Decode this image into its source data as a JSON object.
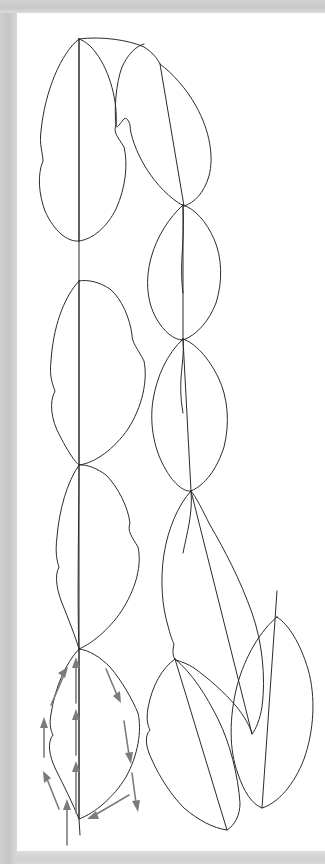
{
  "figure": {
    "page_background": "#ffffff",
    "margin_color": "#c9c9c9",
    "ink_color": "#2b2b2b",
    "arrow_color": "#7b7b7b",
    "canvas": {
      "width": 325,
      "height": 864
    },
    "sheet": {
      "left": 17,
      "top": 13,
      "width": 308,
      "height": 838
    }
  },
  "diagram": {
    "type": "botanical-line-drawing",
    "stem": {
      "name": "main-stem",
      "orientation": "vertical",
      "node_count": 4,
      "path": "M 62 26 L 62 228 L 62 268 C 62 300 62 380 62 452 L 62 490 C 62 540 60 590 62 636 L 62 806 L 63 822"
    },
    "leaves": [
      {
        "id": "leaf-1-left",
        "side": "left",
        "order": 1,
        "lobed": true,
        "notch_side": "both",
        "outline": "M 62 26 C 42 40 26 78 22 118 C 20 134 24 140 25 148 C 20 160 22 180 28 196 C 36 216 50 228 62 228 C 76 226 90 214 98 196 C 108 174 110 150 106 134 C 100 124 96 120 98 112 C 100 90 92 58 78 40 C 73 33 67 28 62 26 Z",
        "midrib": "M 62 26 L 62 228"
      },
      {
        "id": "leaf-2-right",
        "side": "right",
        "order": 1,
        "lobed": true,
        "notch_side": "left",
        "outline": "M 62 26 C 84 24 110 28 124 34 C 132 38 138 44 141 50 C 152 58 166 72 176 90 C 190 114 194 140 190 160 C 185 178 176 188 166 192 C 152 186 138 172 128 156 C 118 140 112 122 112 112 C 110 106 108 104 106 106 C 102 110 98 116 98 112 C 96 96 98 70 104 54 C 110 42 118 34 124 32",
        "midrib": "M 141 50 L 166 192"
      },
      {
        "id": "leaf-3-right",
        "side": "right",
        "order": 2,
        "lobed": false,
        "outline": "M 166 192 C 152 204 140 222 134 244 C 128 266 130 288 138 304 C 146 318 156 326 166 326 C 180 322 192 308 198 290 C 205 268 204 244 196 226 C 188 208 178 196 166 192 Z",
        "midrib": "M 166 192 L 166 326"
      },
      {
        "id": "leaf-4-left",
        "side": "left",
        "order": 2,
        "lobed": true,
        "notch_side": "both",
        "outline": "M 62 268 C 46 284 36 316 34 348 C 32 364 36 372 38 378 C 32 388 34 406 42 422 C 52 440 62 450 62 452 C 78 450 96 436 110 416 C 124 394 130 368 126 348 C 120 336 114 330 114 322 C 112 306 104 286 92 276 C 84 270 72 266 62 268 Z",
        "midrib": "M 62 268 L 62 452"
      },
      {
        "id": "leaf-5-right",
        "side": "right",
        "order": 3,
        "lobed": false,
        "outline": "M 166 326 C 150 340 140 362 136 386 C 132 412 138 438 148 456 C 156 470 166 478 174 478 C 188 472 200 456 206 434 C 212 410 210 384 200 364 C 190 344 178 330 166 326 Z",
        "midrib": "M 166 326 L 174 478"
      },
      {
        "id": "leaf-6-left",
        "side": "left",
        "order": 3,
        "lobed": true,
        "notch_side": "left",
        "outline": "M 62 452 C 50 468 42 498 40 524 C 38 540 40 548 42 554 C 38 562 40 578 46 594 C 54 614 60 628 62 636 C 76 630 94 614 106 594 C 118 574 124 552 120 534 C 114 524 110 518 112 510 C 110 494 100 474 88 462 C 80 456 70 452 62 452 Z",
        "midrib": "M 62 452 L 62 636"
      },
      {
        "id": "leaf-7-right",
        "side": "right",
        "order": 4,
        "lobed": true,
        "notch_side": "left",
        "outline": "M 174 478 C 160 492 150 516 146 540 C 142 566 144 592 150 612 C 152 620 154 626 156 630 C 154 638 155 644 158 646 C 164 648 170 650 176 654 C 190 664 206 678 218 692 C 226 702 232 712 234 720 C 238 716 242 706 244 694 C 248 664 244 628 234 600 C 222 566 206 536 192 512 C 184 496 178 484 174 478 Z",
        "midrib": "M 174 478 L 234 720"
      },
      {
        "id": "leaf-8-far-right",
        "side": "right",
        "order": 5,
        "lobed": false,
        "outline": "M 260 604 C 244 616 228 642 220 672 C 212 704 212 736 220 760 C 226 778 234 790 244 794 C 260 790 276 772 286 746 C 296 718 298 684 290 656 C 282 630 272 612 260 604 Z",
        "midrib": "M 260 580 L 244 794"
      },
      {
        "id": "leaf-9-lower-left",
        "side": "left",
        "order": 6,
        "lobed": true,
        "notch_side": "left",
        "outline": "M 62 636 C 48 650 38 674 34 700 C 32 712 34 718 36 722 C 30 728 32 742 38 756 C 46 772 56 790 62 806 C 78 800 96 784 108 764 C 120 742 124 718 120 700 C 114 686 104 668 92 654 C 82 644 72 638 62 636 Z",
        "midrib": "M 62 636 L 62 806"
      },
      {
        "id": "leaf-10-lower-right",
        "side": "right",
        "order": 7,
        "lobed": true,
        "notch_side": "left",
        "outline": "M 158 646 C 144 654 134 672 130 694 C 128 706 130 712 132 716 C 126 722 128 734 134 746 C 142 764 154 782 166 794 C 180 806 196 814 210 816 C 218 812 222 802 222 790 C 220 762 212 730 200 706 C 188 682 174 660 158 646 Z",
        "midrib": "M 158 646 L 210 816"
      }
    ],
    "arrows": {
      "name": "airflow-arrows",
      "color": "#7b7b7b",
      "count": 12,
      "description": "Gray arrows around the lowest left leaf: upward along the midrib and left margin, downward along the right margin, converging at the base.",
      "items": [
        {
          "id": "arrow-midrib-lower",
          "direction": "up",
          "x1": 59,
          "y1": 800,
          "x2": 59,
          "y2": 752
        },
        {
          "id": "arrow-midrib-mid",
          "direction": "up",
          "x1": 59,
          "y1": 742,
          "x2": 59,
          "y2": 700
        },
        {
          "id": "arrow-midrib-upper",
          "direction": "up",
          "x1": 59,
          "y1": 690,
          "x2": 59,
          "y2": 648
        },
        {
          "id": "arrow-left-upper",
          "direction": "up-right",
          "x1": 36,
          "y1": 692,
          "x2": 50,
          "y2": 656
        },
        {
          "id": "arrow-left-mid",
          "direction": "up",
          "x1": 27,
          "y1": 742,
          "x2": 27,
          "y2": 708
        },
        {
          "id": "arrow-left-lower",
          "direction": "up-left",
          "x1": 42,
          "y1": 796,
          "x2": 28,
          "y2": 760
        },
        {
          "id": "arrow-right-upper",
          "direction": "down-right",
          "x1": 90,
          "y1": 658,
          "x2": 102,
          "y2": 688
        },
        {
          "id": "arrow-right-mid",
          "direction": "down",
          "x1": 108,
          "y1": 710,
          "x2": 113,
          "y2": 748
        },
        {
          "id": "arrow-right-lower",
          "direction": "down",
          "x1": 116,
          "y1": 760,
          "x2": 120,
          "y2": 796
        },
        {
          "id": "arrow-base-inflow",
          "direction": "down-left",
          "x1": 110,
          "y1": 784,
          "x2": 74,
          "y2": 806
        },
        {
          "id": "arrow-base-stem",
          "direction": "up",
          "x1": 50,
          "y1": 852,
          "x2": 50,
          "y2": 816
        }
      ]
    }
  }
}
